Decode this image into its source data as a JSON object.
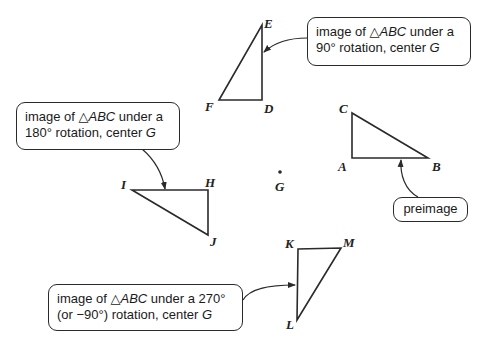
{
  "diagram": {
    "center": {
      "label": "G",
      "x": 280,
      "y": 172
    },
    "triangles": [
      {
        "name": "preimage",
        "vertices": [
          {
            "label": "A",
            "x": 352,
            "y": 158
          },
          {
            "label": "B",
            "x": 428,
            "y": 158
          },
          {
            "label": "C",
            "x": 352,
            "y": 113
          }
        ]
      },
      {
        "name": "rotation-90",
        "vertices": [
          {
            "label": "D",
            "x": 262,
            "y": 100
          },
          {
            "label": "E",
            "x": 262,
            "y": 25
          },
          {
            "label": "F",
            "x": 219,
            "y": 100
          }
        ]
      },
      {
        "name": "rotation-180",
        "vertices": [
          {
            "label": "H",
            "x": 208,
            "y": 190
          },
          {
            "label": "I",
            "x": 132,
            "y": 190
          },
          {
            "label": "J",
            "x": 208,
            "y": 235
          }
        ]
      },
      {
        "name": "rotation-270",
        "vertices": [
          {
            "label": "K",
            "x": 298,
            "y": 249
          },
          {
            "label": "L",
            "x": 297,
            "y": 320
          },
          {
            "label": "M",
            "x": 341,
            "y": 248
          }
        ]
      }
    ]
  },
  "callouts": {
    "rot90": {
      "line1_prefix": "image of ",
      "triangle_glyph": "△",
      "tri_name": "ABC",
      "line1_suffix": " under a",
      "line2_prefix": "90° rotation, center ",
      "center": "G"
    },
    "rot180": {
      "line1_prefix": "image of ",
      "triangle_glyph": "△",
      "tri_name": "ABC",
      "line1_suffix": " under a",
      "line2_prefix": "180° rotation, center ",
      "center": "G"
    },
    "rot270": {
      "line1_prefix": "image of ",
      "triangle_glyph": "△",
      "tri_name": "ABC",
      "line1_suffix": " under a 270°",
      "line2_prefix": "(or −90°) rotation, center ",
      "center": "G"
    },
    "preimage": {
      "label": "preimage"
    }
  },
  "labels": {
    "A": "A",
    "B": "B",
    "C": "C",
    "D": "D",
    "E": "E",
    "F": "F",
    "G": "G",
    "H": "H",
    "I": "I",
    "J": "J",
    "K": "K",
    "L": "L",
    "M": "M"
  },
  "colors": {
    "stroke": "#2a2a2a",
    "background": "#ffffff"
  }
}
